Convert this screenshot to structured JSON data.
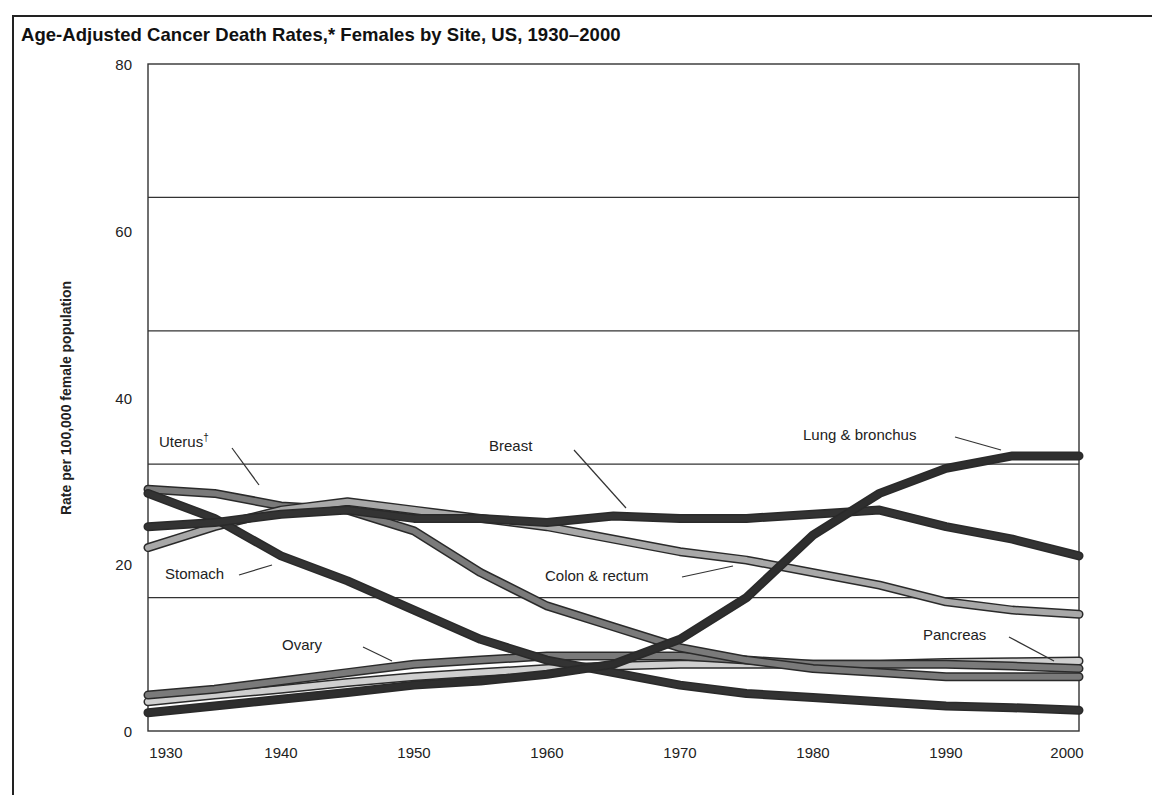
{
  "chart_data": {
    "type": "line",
    "title": "Age-Adjusted Cancer Death Rates,* Females by Site, US, 1930–2000",
    "xlabel": "",
    "ylabel": "Rate per 100,000 female population",
    "xlim": [
      1930,
      2000
    ],
    "ylim": [
      0,
      80
    ],
    "x_ticks": [
      "1930",
      "1940",
      "1950",
      "1960",
      "1970",
      "1980",
      "1990",
      "2000"
    ],
    "y_ticks": [
      "0",
      "20",
      "40",
      "60",
      "80"
    ],
    "gridlines_y": [
      16,
      32,
      48,
      64
    ],
    "grid": true,
    "legend": "inline labels with leader lines",
    "x": [
      1930,
      1935,
      1940,
      1945,
      1950,
      1955,
      1960,
      1965,
      1970,
      1975,
      1980,
      1985,
      1990,
      1995,
      2000
    ],
    "series": [
      {
        "name": "Lung & bronchus",
        "color": "#2e2e2e",
        "values": [
          2.2,
          3.0,
          3.8,
          4.6,
          5.5,
          6.0,
          6.8,
          8.0,
          11.0,
          16.0,
          23.5,
          28.5,
          31.5,
          33.0,
          33.0
        ]
      },
      {
        "name": "Breast",
        "color": "#333333",
        "values": [
          24.5,
          25.0,
          26.0,
          26.5,
          25.5,
          25.5,
          25.0,
          25.8,
          25.5,
          25.5,
          26.0,
          26.5,
          24.5,
          23.0,
          21.0
        ]
      },
      {
        "name": "Colon & rectum",
        "color": "#a8a8a8",
        "values": [
          22.0,
          24.5,
          26.5,
          27.5,
          26.5,
          25.5,
          24.5,
          23.0,
          21.5,
          20.5,
          19.0,
          17.5,
          15.5,
          14.5,
          14.0
        ]
      },
      {
        "name": "Stomach",
        "color": "#333333",
        "values": [
          28.5,
          25.5,
          21.0,
          18.0,
          14.5,
          11.0,
          8.5,
          7.0,
          5.5,
          4.5,
          4.0,
          3.5,
          3.0,
          2.8,
          2.5
        ]
      },
      {
        "name": "Uterus†",
        "color": "#7a7a7a",
        "values": [
          29.0,
          28.5,
          27.0,
          26.5,
          24.0,
          19.0,
          15.0,
          12.5,
          10.0,
          8.5,
          7.5,
          7.0,
          6.5,
          6.5,
          6.5
        ]
      },
      {
        "name": "Ovary",
        "color": "#7a7a7a",
        "values": [
          4.3,
          5.0,
          6.0,
          7.0,
          8.0,
          8.5,
          9.0,
          9.0,
          9.0,
          8.5,
          8.0,
          8.0,
          8.0,
          7.8,
          7.5
        ]
      },
      {
        "name": "Pancreas",
        "color": "#cfcfcf",
        "values": [
          3.5,
          4.3,
          5.0,
          5.8,
          6.5,
          7.0,
          7.5,
          7.8,
          8.0,
          8.0,
          8.0,
          8.0,
          8.2,
          8.3,
          8.4
        ]
      }
    ],
    "annotations": [
      {
        "text": "Uterus†",
        "x": 1933,
        "y": 34
      },
      {
        "text": "Breast",
        "x": 1958,
        "y": 34
      },
      {
        "text": "Lung & bronchus",
        "x": 1985,
        "y": 36
      },
      {
        "text": "Stomach",
        "x": 1933,
        "y": 19
      },
      {
        "text": "Colon & rectum",
        "x": 1965,
        "y": 19
      },
      {
        "text": "Ovary",
        "x": 1941,
        "y": 11
      },
      {
        "text": "Pancreas",
        "x": 1991,
        "y": 11
      }
    ]
  },
  "labels": {
    "uterus_main": "Uterus",
    "uterus_mark": "†",
    "breast": "Breast",
    "lung": "Lung & bronchus",
    "stomach": "Stomach",
    "colon": "Colon & rectum",
    "ovary": "Ovary",
    "pancreas": "Pancreas"
  }
}
